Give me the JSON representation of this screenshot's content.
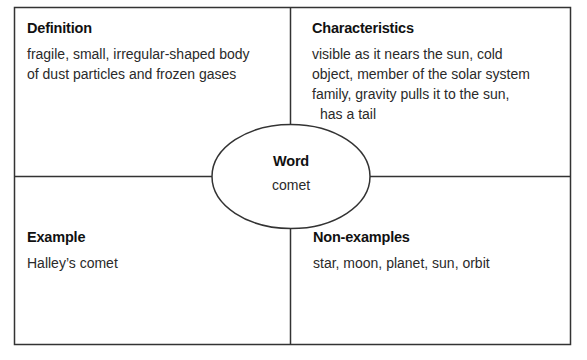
{
  "frayer_model": {
    "definition": {
      "title": "Definition",
      "lines": [
        "fragile, small, irregular-shaped body",
        "of dust particles and frozen gases"
      ]
    },
    "characteristics": {
      "title": "Characteristics",
      "lines": [
        "visible as it nears the sun, cold",
        "object, member of the solar system",
        "family, gravity pulls it to the sun,",
        "has a tail"
      ]
    },
    "word": {
      "title": "Word",
      "value": "comet"
    },
    "example": {
      "title": "Example",
      "lines": [
        "Halley’s comet"
      ]
    },
    "non_examples": {
      "title": "Non-examples",
      "lines": [
        "star, moon, planet, sun, orbit"
      ]
    }
  },
  "colors": {
    "line": "#333333",
    "background": "#ffffff"
  }
}
